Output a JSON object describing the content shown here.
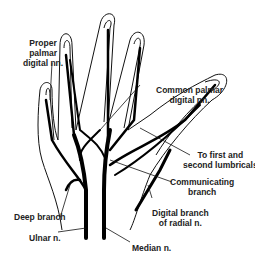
{
  "diagram": {
    "labels": {
      "proper_palmar": "Proper\npalmar\ndigital nn.",
      "common_palmar": "Common palmar\ndigital nn.",
      "lumbricals": "To first and\nsecond lumbricals",
      "communicating": "Communicating\nbranch",
      "deep_branch": "Deep branch",
      "digital_radial": "Digital branch\nof radial n.",
      "ulnar": "Ulnar n.",
      "median": "Median n."
    }
  }
}
